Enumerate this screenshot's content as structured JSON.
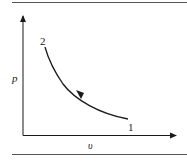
{
  "diagram": {
    "type": "p-v diagram",
    "axes": {
      "y_label": "p",
      "x_label": "υ"
    },
    "points": [
      {
        "label": "1",
        "description": "start state (high volume, low pressure)"
      },
      {
        "label": "2",
        "description": "end state (low volume, high pressure)"
      }
    ],
    "process": {
      "direction": "from 1 to 2",
      "shape": "decreasing convex curve (compression)"
    },
    "colors": {
      "line": "#1a1a1a",
      "rule": "#555555",
      "background": "#ffffff"
    }
  }
}
